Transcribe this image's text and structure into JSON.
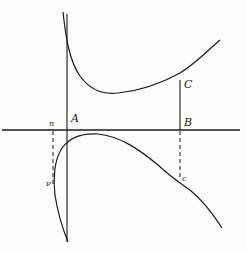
{
  "diagram": {
    "type": "curve-with-asymptote",
    "colors": {
      "ink": "#1a1a1a",
      "paper": "#fdfdfb"
    },
    "labels": {
      "A": "A",
      "B": "B",
      "C": "C",
      "c": "c",
      "n": "n",
      "nu": "ν"
    },
    "elements": [
      "horizontal axis line",
      "vertical asymptote line through A",
      "upper branch of curve with minimum right of A",
      "lower branch of curve (loop) below axis",
      "solid segment BC",
      "dashed segment from B down to c",
      "dashed segment from n down to ν"
    ]
  }
}
